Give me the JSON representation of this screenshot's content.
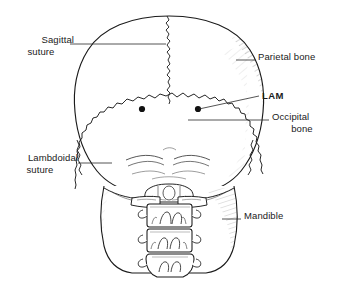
{
  "figure": {
    "background_color": "#ffffff",
    "ink_color": "#1a1a1a"
  },
  "labels": [
    {
      "id": "sagittal-suture",
      "line1": "Sagittal",
      "line2": "suture",
      "bold": false,
      "align": "right"
    },
    {
      "id": "lambdoidal-suture",
      "line1": "Lambdoidal",
      "line2": "suture",
      "bold": false,
      "align": "right"
    },
    {
      "id": "parietal-bone",
      "line1": "Parietal bone",
      "line2": "",
      "bold": false,
      "align": "left"
    },
    {
      "id": "lam",
      "line1": "LAM",
      "line2": "",
      "bold": true,
      "align": "left"
    },
    {
      "id": "occipital-bone",
      "line1": "Occipital",
      "line2": "bone",
      "bold": false,
      "align": "left"
    },
    {
      "id": "mandible",
      "line1": "Mandible",
      "line2": "",
      "bold": false,
      "align": "left"
    }
  ],
  "markers": {
    "lam_point_left": "lam-dot-left",
    "lam_point_right": "lam-dot-right"
  },
  "anatomy": {
    "cranium": "cranial-vault",
    "sagittal_suture": "sagittal-suture-line",
    "lambdoid_suture": "lambdoid-suture-line",
    "occipital": "occipital-bone-region",
    "mandible_left": "mandible-ramus-left",
    "mandible_right": "mandible-ramus-right",
    "vertebrae": [
      "vertebra-c1",
      "vertebra-c2",
      "vertebra-c3",
      "vertebra-c4"
    ]
  }
}
